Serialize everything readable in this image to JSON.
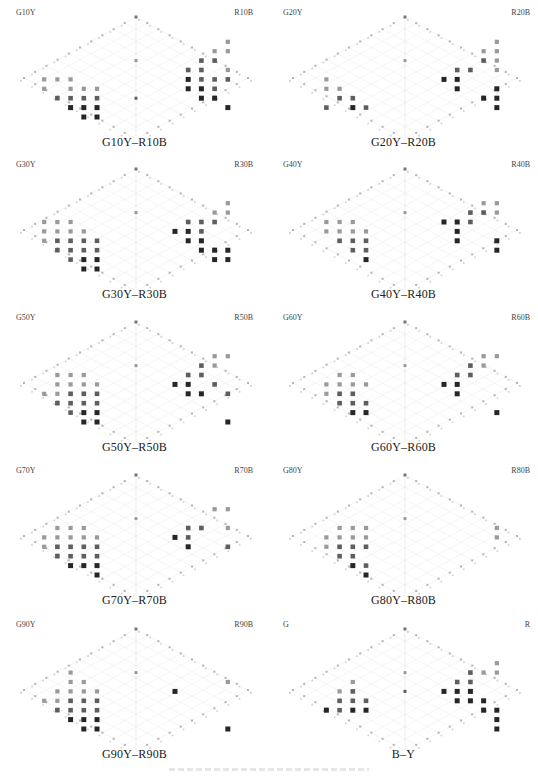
{
  "chart_data": [
    {
      "type": "scatter",
      "title": "G10Y–R10B",
      "left_label": "G10Y",
      "right_label": "R10B",
      "grid": true,
      "points_left": [
        [
          1,
          6,
          1
        ],
        [
          2,
          6,
          1
        ],
        [
          3,
          6,
          1
        ],
        [
          1,
          7,
          1
        ],
        [
          3,
          7,
          1
        ],
        [
          4,
          7,
          1
        ],
        [
          5,
          7,
          1
        ],
        [
          2,
          8,
          2
        ],
        [
          3,
          8,
          2
        ],
        [
          4,
          8,
          2
        ],
        [
          5,
          8,
          2
        ],
        [
          3,
          9,
          3
        ],
        [
          4,
          9,
          3
        ],
        [
          5,
          9,
          3
        ],
        [
          4,
          10,
          3
        ],
        [
          5,
          10,
          3
        ]
      ],
      "points_right": [
        [
          1,
          2,
          1
        ],
        [
          1,
          3,
          1
        ],
        [
          2,
          3,
          1
        ],
        [
          2,
          4,
          2
        ],
        [
          3,
          4,
          2
        ],
        [
          1,
          5,
          1
        ],
        [
          3,
          5,
          2
        ],
        [
          4,
          5,
          2
        ],
        [
          1,
          6,
          2
        ],
        [
          2,
          6,
          2
        ],
        [
          3,
          6,
          2
        ],
        [
          4,
          6,
          3
        ],
        [
          2,
          7,
          2
        ],
        [
          3,
          7,
          3
        ],
        [
          4,
          7,
          3
        ],
        [
          3,
          8,
          3
        ],
        [
          1,
          9,
          3
        ],
        [
          2,
          8,
          3
        ]
      ],
      "points_axis": [
        [
          4,
          1
        ],
        [
          8,
          2
        ]
      ]
    },
    {
      "type": "scatter",
      "title": "G20Y–R20B",
      "left_label": "G20Y",
      "right_label": "R20B",
      "grid": true,
      "points_left": [
        [
          2,
          6,
          1
        ],
        [
          2,
          7,
          1
        ],
        [
          3,
          7,
          1
        ],
        [
          3,
          8,
          2
        ],
        [
          4,
          8,
          2
        ],
        [
          4,
          9,
          3
        ],
        [
          5,
          9,
          2
        ],
        [
          2,
          9,
          2
        ]
      ],
      "points_right": [
        [
          1,
          2,
          1
        ],
        [
          1,
          3,
          1
        ],
        [
          2,
          3,
          1
        ],
        [
          1,
          4,
          1
        ],
        [
          2,
          4,
          2
        ],
        [
          1,
          5,
          1
        ],
        [
          3,
          5,
          2
        ],
        [
          4,
          5,
          2
        ],
        [
          4,
          6,
          3
        ],
        [
          5,
          6,
          3
        ],
        [
          4,
          7,
          3
        ],
        [
          1,
          7,
          3
        ],
        [
          1,
          8,
          3
        ],
        [
          2,
          8,
          3
        ],
        [
          1,
          9,
          3
        ]
      ],
      "points_axis": [
        [
          4,
          1
        ]
      ]
    },
    {
      "type": "scatter",
      "title": "G30Y–R30B",
      "left_label": "G30Y",
      "right_label": "R30B",
      "grid": true,
      "points_left": [
        [
          1,
          5,
          1
        ],
        [
          2,
          5,
          1
        ],
        [
          3,
          5,
          1
        ],
        [
          1,
          6,
          1
        ],
        [
          2,
          6,
          1
        ],
        [
          3,
          6,
          1
        ],
        [
          4,
          6,
          1
        ],
        [
          1,
          7,
          1
        ],
        [
          2,
          7,
          2
        ],
        [
          3,
          7,
          2
        ],
        [
          4,
          7,
          2
        ],
        [
          5,
          7,
          2
        ],
        [
          2,
          8,
          2
        ],
        [
          3,
          8,
          2
        ],
        [
          4,
          8,
          2
        ],
        [
          5,
          8,
          2
        ],
        [
          3,
          9,
          2
        ],
        [
          4,
          9,
          3
        ],
        [
          5,
          9,
          3
        ],
        [
          4,
          10,
          3
        ],
        [
          5,
          10,
          3
        ]
      ],
      "points_right": [
        [
          1,
          3,
          1
        ],
        [
          1,
          4,
          1
        ],
        [
          2,
          4,
          1
        ],
        [
          2,
          5,
          2
        ],
        [
          3,
          5,
          2
        ],
        [
          4,
          5,
          2
        ],
        [
          3,
          6,
          2
        ],
        [
          4,
          6,
          3
        ],
        [
          5,
          6,
          3
        ],
        [
          3,
          7,
          3
        ],
        [
          4,
          7,
          3
        ],
        [
          1,
          8,
          3
        ],
        [
          2,
          8,
          3
        ],
        [
          3,
          8,
          3
        ],
        [
          1,
          9,
          3
        ],
        [
          2,
          9,
          3
        ]
      ],
      "points_axis": [
        [
          4,
          1
        ]
      ]
    },
    {
      "type": "scatter",
      "title": "G40Y–R40B",
      "left_label": "G40Y",
      "right_label": "R40B",
      "grid": true,
      "points_left": [
        [
          2,
          5,
          1
        ],
        [
          3,
          5,
          1
        ],
        [
          4,
          5,
          1
        ],
        [
          2,
          6,
          1
        ],
        [
          3,
          6,
          1
        ],
        [
          4,
          6,
          1
        ],
        [
          5,
          6,
          1
        ],
        [
          3,
          7,
          2
        ],
        [
          4,
          7,
          2
        ],
        [
          5,
          7,
          2
        ],
        [
          4,
          8,
          2
        ],
        [
          5,
          8,
          2
        ],
        [
          5,
          9,
          3
        ]
      ],
      "points_right": [
        [
          1,
          3,
          1
        ],
        [
          2,
          3,
          1
        ],
        [
          1,
          4,
          1
        ],
        [
          2,
          4,
          2
        ],
        [
          3,
          4,
          2
        ],
        [
          3,
          5,
          2
        ],
        [
          4,
          5,
          3
        ],
        [
          5,
          5,
          3
        ],
        [
          1,
          7,
          3
        ],
        [
          4,
          6,
          3
        ],
        [
          1,
          8,
          3
        ],
        [
          4,
          7,
          3
        ]
      ],
      "points_axis": [
        [
          4,
          1
        ]
      ]
    },
    {
      "type": "scatter",
      "title": "G50Y–R50B",
      "left_label": "G50Y",
      "right_label": "R50B",
      "grid": true,
      "points_left": [
        [
          2,
          5,
          1
        ],
        [
          3,
          5,
          1
        ],
        [
          4,
          5,
          1
        ],
        [
          2,
          6,
          1
        ],
        [
          3,
          6,
          1
        ],
        [
          4,
          6,
          1
        ],
        [
          5,
          6,
          1
        ],
        [
          1,
          7,
          1
        ],
        [
          2,
          7,
          1
        ],
        [
          3,
          7,
          2
        ],
        [
          4,
          7,
          2
        ],
        [
          5,
          7,
          2
        ],
        [
          2,
          8,
          2
        ],
        [
          3,
          8,
          2
        ],
        [
          4,
          8,
          2
        ],
        [
          5,
          8,
          2
        ],
        [
          3,
          9,
          2
        ],
        [
          4,
          9,
          3
        ],
        [
          5,
          9,
          3
        ],
        [
          4,
          10,
          3
        ],
        [
          5,
          10,
          3
        ]
      ],
      "points_right": [
        [
          1,
          3,
          1
        ],
        [
          2,
          3,
          1
        ],
        [
          2,
          4,
          1
        ],
        [
          3,
          4,
          2
        ],
        [
          3,
          5,
          2
        ],
        [
          4,
          5,
          2
        ],
        [
          2,
          6,
          2
        ],
        [
          4,
          6,
          3
        ],
        [
          5,
          6,
          3
        ],
        [
          1,
          7,
          2
        ],
        [
          3,
          7,
          3
        ],
        [
          4,
          7,
          3
        ],
        [
          1,
          10,
          3
        ]
      ],
      "points_axis": [
        [
          4,
          1
        ]
      ]
    },
    {
      "type": "scatter",
      "title": "G60Y–R60B",
      "left_label": "G60Y",
      "right_label": "R60B",
      "grid": true,
      "points_left": [
        [
          3,
          5,
          1
        ],
        [
          4,
          5,
          1
        ],
        [
          2,
          6,
          1
        ],
        [
          3,
          6,
          1
        ],
        [
          4,
          6,
          1
        ],
        [
          5,
          6,
          1
        ],
        [
          2,
          7,
          1
        ],
        [
          3,
          7,
          2
        ],
        [
          4,
          7,
          2
        ],
        [
          3,
          8,
          2
        ],
        [
          4,
          8,
          2
        ],
        [
          5,
          8,
          2
        ],
        [
          4,
          9,
          3
        ],
        [
          5,
          9,
          3
        ]
      ],
      "points_right": [
        [
          1,
          3,
          1
        ],
        [
          2,
          3,
          1
        ],
        [
          2,
          4,
          1
        ],
        [
          3,
          4,
          2
        ],
        [
          3,
          5,
          2
        ],
        [
          4,
          5,
          2
        ],
        [
          4,
          6,
          3
        ],
        [
          5,
          6,
          3
        ],
        [
          4,
          7,
          3
        ],
        [
          1,
          9,
          3
        ]
      ],
      "points_axis": [
        [
          4,
          1
        ]
      ]
    },
    {
      "type": "scatter",
      "title": "G70Y–R70B",
      "left_label": "G70Y",
      "right_label": "R70B",
      "grid": true,
      "points_left": [
        [
          2,
          5,
          1
        ],
        [
          3,
          5,
          1
        ],
        [
          4,
          5,
          1
        ],
        [
          1,
          6,
          1
        ],
        [
          2,
          6,
          1
        ],
        [
          3,
          6,
          1
        ],
        [
          4,
          6,
          1
        ],
        [
          5,
          6,
          1
        ],
        [
          1,
          7,
          1
        ],
        [
          2,
          7,
          2
        ],
        [
          3,
          7,
          2
        ],
        [
          4,
          7,
          2
        ],
        [
          5,
          7,
          2
        ],
        [
          2,
          8,
          2
        ],
        [
          3,
          8,
          2
        ],
        [
          4,
          8,
          2
        ],
        [
          5,
          8,
          2
        ],
        [
          3,
          9,
          3
        ],
        [
          4,
          9,
          3
        ],
        [
          5,
          9,
          3
        ],
        [
          5,
          10,
          3
        ]
      ],
      "points_right": [
        [
          1,
          3,
          1
        ],
        [
          2,
          3,
          1
        ],
        [
          1,
          5,
          1
        ],
        [
          3,
          5,
          2
        ],
        [
          4,
          5,
          2
        ],
        [
          4,
          6,
          2
        ],
        [
          5,
          6,
          3
        ],
        [
          1,
          7,
          2
        ],
        [
          4,
          7,
          3
        ]
      ],
      "points_axis": [
        [
          4,
          1
        ]
      ]
    },
    {
      "type": "scatter",
      "title": "G80Y–R80B",
      "left_label": "G80Y",
      "right_label": "R80B",
      "grid": true,
      "points_left": [
        [
          3,
          5,
          1
        ],
        [
          4,
          5,
          1
        ],
        [
          5,
          5,
          1
        ],
        [
          2,
          6,
          1
        ],
        [
          3,
          6,
          1
        ],
        [
          4,
          6,
          1
        ],
        [
          5,
          6,
          1
        ],
        [
          2,
          7,
          1
        ],
        [
          3,
          7,
          2
        ],
        [
          4,
          7,
          2
        ],
        [
          5,
          7,
          2
        ],
        [
          3,
          8,
          2
        ],
        [
          4,
          8,
          2
        ],
        [
          4,
          9,
          3
        ],
        [
          5,
          9,
          2
        ],
        [
          5,
          10,
          3
        ]
      ],
      "points_right": [
        [
          1,
          5,
          1
        ],
        [
          1,
          6,
          1
        ]
      ],
      "points_axis": [
        [
          4,
          1
        ]
      ]
    },
    {
      "type": "scatter",
      "title": "G90Y–R90B",
      "left_label": "G90Y",
      "right_label": "R90B",
      "grid": true,
      "points_left": [
        [
          3,
          4,
          1
        ],
        [
          3,
          5,
          1
        ],
        [
          4,
          5,
          1
        ],
        [
          2,
          6,
          1
        ],
        [
          3,
          6,
          1
        ],
        [
          4,
          6,
          1
        ],
        [
          5,
          6,
          1
        ],
        [
          1,
          7,
          1
        ],
        [
          2,
          7,
          1
        ],
        [
          3,
          7,
          2
        ],
        [
          4,
          7,
          2
        ],
        [
          5,
          7,
          2
        ],
        [
          2,
          8,
          2
        ],
        [
          3,
          8,
          2
        ],
        [
          4,
          8,
          2
        ],
        [
          5,
          8,
          2
        ],
        [
          3,
          9,
          3
        ],
        [
          4,
          9,
          3
        ],
        [
          5,
          9,
          3
        ],
        [
          4,
          10,
          3
        ],
        [
          5,
          10,
          3
        ]
      ],
      "points_right": [
        [
          1,
          5,
          1
        ],
        [
          1,
          10,
          3
        ],
        [
          5,
          6,
          3
        ]
      ],
      "points_axis": [
        [
          4,
          1
        ]
      ]
    },
    {
      "type": "scatter",
      "title": "B–Y",
      "left_label": "G",
      "right_label": "R",
      "grid": true,
      "points_left": [
        [
          4,
          5,
          1
        ],
        [
          3,
          6,
          1
        ],
        [
          4,
          6,
          2
        ],
        [
          3,
          7,
          2
        ],
        [
          4,
          7,
          2
        ],
        [
          5,
          7,
          2
        ],
        [
          2,
          8,
          3
        ],
        [
          3,
          8,
          2
        ],
        [
          4,
          8,
          3
        ],
        [
          5,
          8,
          3
        ]
      ],
      "points_right": [
        [
          1,
          3,
          1
        ],
        [
          1,
          4,
          1
        ],
        [
          2,
          4,
          1
        ],
        [
          3,
          4,
          2
        ],
        [
          3,
          5,
          2
        ],
        [
          4,
          5,
          2
        ],
        [
          3,
          6,
          3
        ],
        [
          4,
          6,
          3
        ],
        [
          5,
          6,
          3
        ],
        [
          2,
          7,
          3
        ],
        [
          3,
          7,
          3
        ],
        [
          4,
          7,
          3
        ],
        [
          1,
          8,
          3
        ],
        [
          2,
          8,
          3
        ],
        [
          1,
          9,
          3
        ],
        [
          1,
          10,
          3
        ]
      ],
      "points_axis": [
        [
          4,
          1
        ],
        [
          6,
          2
        ]
      ]
    }
  ]
}
